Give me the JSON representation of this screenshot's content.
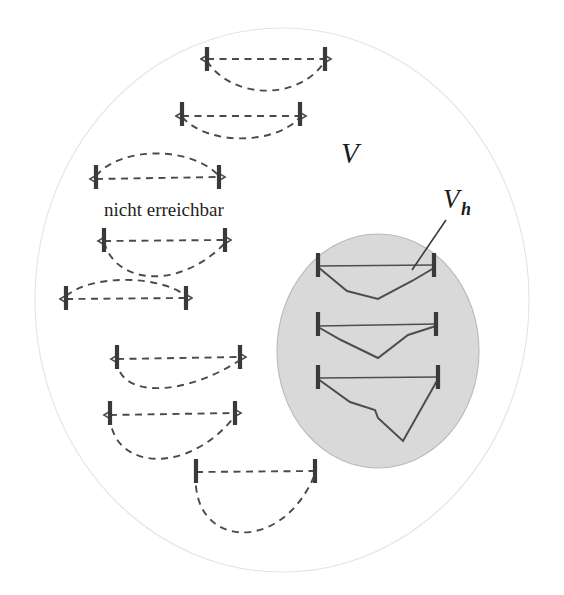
{
  "figure": {
    "background_color": "#ffffff",
    "labels": {
      "outer_region": "V",
      "sub_region_main": "V",
      "sub_region_subscript": "h",
      "annotation": "nicht erreichbar"
    },
    "colors": {
      "outer_fill": "#ffffff",
      "outer_stroke": "#e3e3e3",
      "sub_fill": "#d9d9d9",
      "sub_stroke": "#b9b9b9",
      "dashed_stroke": "#4a4a4a",
      "solid_stroke": "#4d4d4d",
      "endpoint_stroke": "#3a3a3a",
      "text_color": "#1a1a1a"
    },
    "outer_region": {
      "name": "V",
      "cx": 282,
      "cy": 300,
      "rx": 247,
      "ry": 272
    },
    "sub_region": {
      "name": "Vh",
      "cx": 378,
      "cy": 351,
      "rx": 101,
      "ry": 117
    },
    "annotation_position": {
      "x": 104,
      "y": 216
    },
    "outer_label_position": {
      "x": 341,
      "y": 163
    },
    "sub_label_position": {
      "x": 443,
      "y": 208
    },
    "leader_line": {
      "x1": 446,
      "y1": 220,
      "x2": 412,
      "y2": 270
    },
    "unreachable_elements": [
      {
        "id": "dashed-1",
        "shape": "sag-down-symmetric",
        "left_bar": {
          "x": 207,
          "y": 59,
          "half_height": 12
        },
        "right_bar": {
          "x": 325,
          "y": 59,
          "half_height": 12
        },
        "chord": "M207,59 L325,59",
        "curve": "M207,61 C232,100 300,101 325,61",
        "arrow_left": true,
        "arrow_right": true
      },
      {
        "id": "dashed-2",
        "shape": "sag-down-shallow",
        "left_bar": {
          "x": 182,
          "y": 114,
          "half_height": 12
        },
        "right_bar": {
          "x": 300,
          "y": 114,
          "half_height": 12
        },
        "chord": "M182,116 L300,116",
        "curve": "M182,117 C208,146 276,145 300,117",
        "arrow_left": true,
        "arrow_right": true
      },
      {
        "id": "dashed-3",
        "shape": "bulge-up",
        "left_bar": {
          "x": 96,
          "y": 177,
          "half_height": 12
        },
        "right_bar": {
          "x": 219,
          "y": 177,
          "half_height": 12
        },
        "chord": "M96,179 L219,177",
        "curve": "M96,176 C120,146 192,146 219,176",
        "arrow_left": true,
        "arrow_right": true
      },
      {
        "id": "dashed-4",
        "shape": "sag-down-asym-right",
        "left_bar": {
          "x": 104,
          "y": 240,
          "half_height": 12
        },
        "right_bar": {
          "x": 225,
          "y": 240,
          "half_height": 12
        },
        "chord": "M104,241 L225,240",
        "curve": "M104,242 C116,285 180,290 225,243",
        "arrow_left": true,
        "arrow_right": true
      },
      {
        "id": "dashed-5",
        "shape": "bulge-up",
        "left_bar": {
          "x": 66,
          "y": 298,
          "half_height": 12
        },
        "right_bar": {
          "x": 186,
          "y": 298,
          "half_height": 12
        },
        "chord": "M66,299 L186,298",
        "curve": "M66,296 C92,274 160,275 186,296",
        "arrow_left": true,
        "arrow_right": true
      },
      {
        "id": "dashed-6",
        "shape": "sag-down-asym-left",
        "left_bar": {
          "x": 117,
          "y": 357,
          "half_height": 12
        },
        "right_bar": {
          "x": 240,
          "y": 357,
          "half_height": 12
        },
        "chord": "M117,359 L240,357",
        "curve": "M117,360 C118,399 186,396 240,360",
        "arrow_left": true,
        "arrow_right": true
      },
      {
        "id": "dashed-7",
        "shape": "sag-down-deep",
        "left_bar": {
          "x": 110,
          "y": 413,
          "half_height": 12
        },
        "right_bar": {
          "x": 235,
          "y": 413,
          "half_height": 12
        },
        "chord": "M110,415 L235,413",
        "curve": "M110,416 C112,470 188,476 235,416",
        "arrow_left": true,
        "arrow_right": true
      },
      {
        "id": "dashed-8",
        "shape": "sag-down-very-deep",
        "left_bar": {
          "x": 196,
          "y": 471,
          "half_height": 12
        },
        "right_bar": {
          "x": 315,
          "y": 471,
          "half_height": 12
        },
        "chord": "M196,472 L315,471",
        "curve": "M196,473 C190,548 282,556 315,474",
        "arrow_left": false,
        "arrow_right": false
      }
    ],
    "reachable_elements": [
      {
        "id": "solid-1",
        "shape": "polyline-v-dip",
        "left_bar": {
          "x": 318,
          "y": 265,
          "half_height": 12
        },
        "right_bar": {
          "x": 434,
          "y": 265,
          "half_height": 12
        },
        "chord": "M318,266 L434,265",
        "curve": "M318,267 L347,291 L378,299 L412,281 L434,268"
      },
      {
        "id": "solid-2",
        "shape": "polyline-v-dip",
        "left_bar": {
          "x": 318,
          "y": 324,
          "half_height": 12
        },
        "right_bar": {
          "x": 436,
          "y": 324,
          "half_height": 12
        },
        "chord": "M318,326 L436,324",
        "curve": "M318,327 L341,340 L378,358 L408,335 L436,326"
      },
      {
        "id": "solid-3",
        "shape": "polyline-deep-v",
        "left_bar": {
          "x": 318,
          "y": 377,
          "half_height": 12
        },
        "right_bar": {
          "x": 438,
          "y": 377,
          "half_height": 12
        },
        "chord": "M318,378 L438,377",
        "curve": "M318,379 L350,402 L375,410 L378,418 L403,441 L438,379"
      }
    ]
  }
}
